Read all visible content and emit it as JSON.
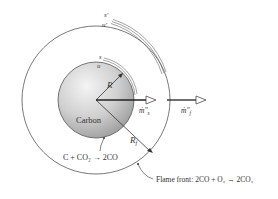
{
  "diagram": {
    "type": "spherical-carbon-combustion-schematic",
    "colors": {
      "background": "#ffffff",
      "outline": "#555555",
      "sphere_light": "#f2f2f2",
      "sphere_dark": "#a8a8a8",
      "text": "#333333"
    },
    "inner_sphere": {
      "label": "Carbon",
      "surface_reaction": "C + CO₂ → 2CO",
      "radius_label": "R",
      "coordinate_labels": {
        "s": "s",
        "u": "u"
      }
    },
    "outer_circle": {
      "radius_label": "R",
      "radius_subscript": "f",
      "coordinate_labels": {
        "s": "s′",
        "u": "u′"
      },
      "flame_reaction_label": "Flame front: 2CO + O₂ → 2CO₂"
    },
    "fluxes": {
      "surface_flux": {
        "symbol": "ṁ″",
        "subscript": "s"
      },
      "flame_flux": {
        "symbol": "ṁ″",
        "subscript": "f"
      }
    }
  }
}
